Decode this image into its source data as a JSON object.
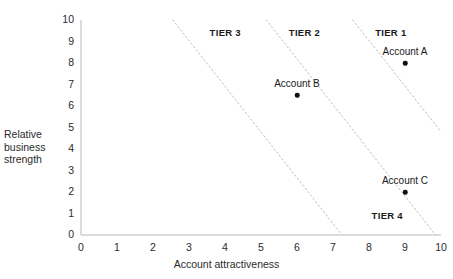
{
  "chart_data": {
    "type": "scatter",
    "title": "",
    "xlabel": "Account attractiveness",
    "ylabel": "Relative business strength",
    "xlim": [
      0,
      10
    ],
    "ylim": [
      0,
      10
    ],
    "xticks": [
      "0",
      "1",
      "2",
      "3",
      "4",
      "5",
      "6",
      "7",
      "8",
      "9",
      "10"
    ],
    "yticks": [
      "0",
      "1",
      "2",
      "3",
      "4",
      "5",
      "6",
      "7",
      "8",
      "9",
      "10"
    ],
    "grid": false,
    "legend": "none",
    "points": [
      {
        "label": "Account A",
        "x": 9.0,
        "y": 8.0
      },
      {
        "label": "Account B",
        "x": 6.0,
        "y": 6.5
      },
      {
        "label": "Account C",
        "x": 9.0,
        "y": 2.0
      }
    ],
    "annotations": [
      {
        "text": "TIER 1",
        "x": 8.7,
        "y": 9.4
      },
      {
        "text": "TIER 2",
        "x": 6.3,
        "y": 9.4
      },
      {
        "text": "TIER 3",
        "x": 4.1,
        "y": 9.4
      },
      {
        "text": "TIER 4",
        "x": 8.6,
        "y": 0.9
      }
    ],
    "boundary_lines": [
      {
        "name": "tier3-tier2-divider",
        "x1": 2.55,
        "y1": 10.0,
        "x2": 7.25,
        "y2": 0.0
      },
      {
        "name": "tier2-tier1-divider",
        "x1": 5.15,
        "y1": 10.0,
        "x2": 9.85,
        "y2": 0.0
      },
      {
        "name": "tier1-tier4-divider",
        "x1": 7.55,
        "y1": 10.0,
        "x2": 10.0,
        "y2": 4.8
      }
    ],
    "axis_color": "#b9b9b9",
    "point_color": "#111111",
    "boundary_color": "#bdbdbd"
  }
}
